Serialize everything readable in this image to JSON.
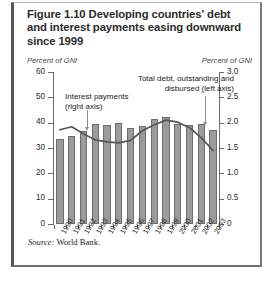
{
  "figure": {
    "title": "Figure 1.10  Developing countries' debt and interest payments easing downward since 1999",
    "source": "Source: World Bank.",
    "source_prefix": "Source:",
    "source_text": " World Bank.",
    "unit_left": "Percent of GNI",
    "unit_right": "Percent of GNI",
    "annotation_interest": "Interest payments (right axis)",
    "annotation_interest_line1": "Interest payments",
    "annotation_interest_line2": "(right axis)",
    "annotation_total": "Total debt, outstanding and disbursed (left axis)",
    "annotation_total_line1": "Total debt, outstanding and",
    "annotation_total_line2": "disbursed (left axis)",
    "colors": {
      "bar_fill": "#9b9b9b",
      "bar_stroke": "#6d6d6d",
      "line": "#555555",
      "axis": "#6b6b6b",
      "text": "#2b2b2b",
      "border": "#55555a"
    }
  },
  "chart_data": {
    "type": "bar",
    "title": "Figure 1.10  Developing countries' debt and interest payments easing downward since 1999",
    "xlabel": "",
    "ylabel": "Percent of GNI",
    "ylabel_right": "Percent of GNI",
    "ylim": [
      0,
      60
    ],
    "ylim_right": [
      0,
      3.0
    ],
    "yticks": [
      0,
      10,
      20,
      30,
      40,
      50,
      60
    ],
    "yticks_right": [
      0,
      0.5,
      1.0,
      1.5,
      2.0,
      2.5,
      3.0
    ],
    "ytick_labels": [
      "0",
      "10",
      "20",
      "30",
      "40",
      "50",
      "60"
    ],
    "ytick_labels_right": [
      "0",
      "0.5",
      "1.0",
      "1.5",
      "2.0",
      "2.5",
      "3.0"
    ],
    "grid": false,
    "legend_position": "inline-annotations",
    "categories": [
      "1990",
      "1991",
      "1992",
      "1993",
      "1994",
      "1995",
      "1996",
      "1997",
      "1998",
      "1999",
      "2000",
      "2001",
      "2002",
      "2003"
    ],
    "series": [
      {
        "name": "Total debt, outstanding and disbursed (left axis)",
        "type": "bar",
        "axis": "left",
        "values": [
          33.4,
          34.6,
          36.8,
          39.4,
          39.1,
          39.8,
          37.9,
          38.8,
          41.4,
          42.1,
          39.4,
          39.2,
          39.4,
          37.2
        ]
      },
      {
        "name": "Interest payments (right axis)",
        "type": "line",
        "axis": "right",
        "values": [
          1.86,
          1.92,
          1.78,
          1.66,
          1.62,
          1.6,
          1.65,
          1.84,
          1.96,
          2.05,
          2.01,
          1.9,
          1.7,
          1.45
        ]
      }
    ]
  }
}
